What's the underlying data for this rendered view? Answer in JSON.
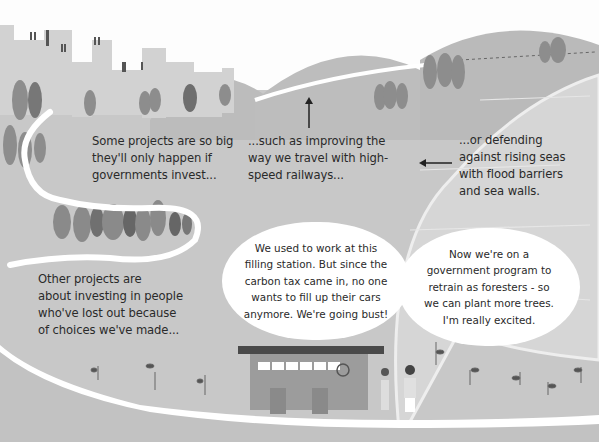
{
  "illustration": {
    "captions": {
      "big_projects": [
        "Some projects are so big",
        "they'll only happen if",
        "governments invest..."
      ],
      "railways": [
        "...such as improving the",
        "way we travel with high-",
        "speed railways..."
      ],
      "sea_defences": [
        "...or defending",
        "against rising seas",
        "with flood barriers",
        "and sea walls."
      ],
      "people": [
        "Other projects are",
        "about investing in people",
        "who've lost out because",
        "of choices we've made..."
      ]
    },
    "speech_bubbles": {
      "worker_left": "We used to work at this\nfilling station. But since the\ncarbon tax came in, no one\nwants to fill up their cars\nanymore. We're going bust!",
      "worker_right": "Now we're on a\ngovernment program to\nretrain as foresters - so\nwe can plant more trees.\nI'm really excited."
    },
    "colors": {
      "ground": "#c9c9c9",
      "hill": "#bdbdbd",
      "sea": "#d4d4d4",
      "text": "#2a2a2a",
      "road": "#ffffff"
    }
  }
}
